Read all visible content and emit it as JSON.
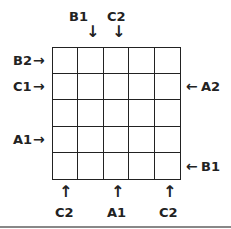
{
  "diagram": {
    "rows": 5,
    "cols": 5,
    "top_labels": [
      {
        "text": "B1",
        "col": 1
      },
      {
        "text": "C2",
        "col": 2
      }
    ],
    "left_labels": [
      {
        "text": "B2",
        "row": 0
      },
      {
        "text": "C1",
        "row": 1
      },
      {
        "text": "A1",
        "row": 3
      }
    ],
    "right_labels": [
      {
        "text": "A2",
        "row": 1
      },
      {
        "text": "B1",
        "row": 4
      }
    ],
    "bottom_labels": [
      {
        "text": "C2",
        "col": 0
      },
      {
        "text": "A1",
        "col": 2
      },
      {
        "text": "C2",
        "col": 4
      }
    ]
  }
}
